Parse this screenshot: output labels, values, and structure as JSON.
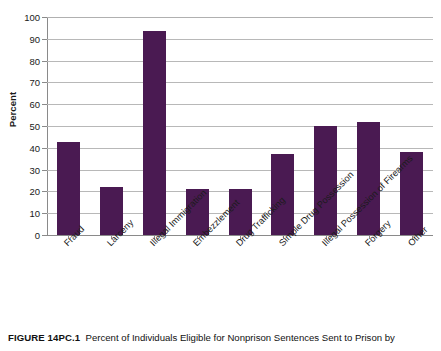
{
  "figure": {
    "caption_label": "FIGURE 14PC.1",
    "caption_text": "Percent of Individuals Eligible for Nonprison Sentences Sent to Prison by"
  },
  "colors": {
    "bar": "#4a1a52",
    "gridline": "#b8b8b8",
    "axis": "#8a8a8a",
    "text": "#1a1a1a",
    "background": "#ffffff"
  },
  "chart_data": {
    "type": "bar",
    "title": "",
    "xlabel": "",
    "ylabel": "Percent",
    "ylim": [
      0,
      100
    ],
    "ytick_step": 10,
    "yticks": [
      0,
      10,
      20,
      30,
      40,
      50,
      60,
      70,
      80,
      90,
      100
    ],
    "ytick_labels": [
      "0",
      "10",
      "20",
      "30",
      "40",
      "50",
      "60",
      "70",
      "80",
      "90",
      "100"
    ],
    "grid": true,
    "grid_axis": "y",
    "legend": false,
    "legend_position": "none",
    "categories": [
      "Fraud",
      "Larceny",
      "Illegal Immigration",
      "Embezzlement",
      "Drug Trafficking",
      "Simple Drug Possession",
      "Illegal Possession of Firearms",
      "Forgery",
      "Other"
    ],
    "values": [
      42.5,
      22,
      93.5,
      21,
      21,
      37,
      50,
      52,
      38
    ],
    "xtick_rotation": -45,
    "bar_color": "#4a1a52"
  }
}
